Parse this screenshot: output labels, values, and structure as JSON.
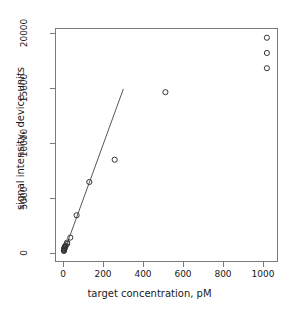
{
  "chart_data": {
    "type": "scatter",
    "title": "",
    "xlabel": "target concentration, pM",
    "ylabel": "signal intensity, device units",
    "xlim": [
      -40,
      1075
    ],
    "ylim": [
      -800,
      20500
    ],
    "xticks": [
      0,
      200,
      400,
      600,
      800,
      1000
    ],
    "xticklabels": [
      "0",
      "200",
      "400",
      "600",
      "800",
      "1000"
    ],
    "yticks": [
      0,
      5000,
      10000,
      15000,
      20000
    ],
    "yticklabels": [
      "0",
      "5000",
      "10000",
      "15000",
      "20000"
    ],
    "grid": false,
    "legend": null,
    "marker": "open-circle",
    "marker_color": "#333333",
    "marker_radius_px": 2.6,
    "series": [
      {
        "name": "measurements",
        "points": [
          {
            "x": 0,
            "y": 120
          },
          {
            "x": 0,
            "y": 180
          },
          {
            "x": 1,
            "y": 240
          },
          {
            "x": 2,
            "y": 300
          },
          {
            "x": 2,
            "y": 360
          },
          {
            "x": 4,
            "y": 430
          },
          {
            "x": 4,
            "y": 500
          },
          {
            "x": 8,
            "y": 560
          },
          {
            "x": 8,
            "y": 620
          },
          {
            "x": 16,
            "y": 780
          },
          {
            "x": 16,
            "y": 900
          },
          {
            "x": 32,
            "y": 1350
          },
          {
            "x": 64,
            "y": 3400
          },
          {
            "x": 128,
            "y": 6450
          },
          {
            "x": 256,
            "y": 8500
          },
          {
            "x": 512,
            "y": 14700
          },
          {
            "x": 1024,
            "y": 16900
          },
          {
            "x": 1024,
            "y": 18300
          },
          {
            "x": 1024,
            "y": 19700
          }
        ]
      }
    ],
    "fit_line": {
      "name": "linear fit",
      "color": "#555555",
      "width_px": 1,
      "x0": 0,
      "y0": 0,
      "x1": 300,
      "y1": 15000
    }
  }
}
